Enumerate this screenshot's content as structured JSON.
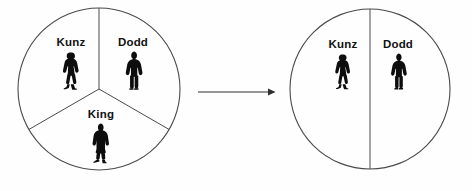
{
  "diagram": {
    "type": "two-state-circle-partition",
    "ink_color": "#4a4a4a",
    "text_color": "#121212",
    "figure_color": "#0d0d0d",
    "background_color": "#ffffff",
    "before": {
      "name": "before-circle",
      "description": "Circle divided into three equal segments",
      "segment_count": 3,
      "center_x": 99,
      "center_y": 89,
      "radius": 81,
      "segments": [
        {
          "id": "kunz",
          "label": "Kunz",
          "label_x": 71,
          "label_y": 46,
          "figure": "woman-walking",
          "figure_x": 72,
          "figure_y": 52,
          "figure_h": 38
        },
        {
          "id": "dodd",
          "label": "Dodd",
          "label_x": 133,
          "label_y": 46,
          "figure": "man-in-suit",
          "figure_x": 134,
          "figure_y": 52,
          "figure_h": 39
        },
        {
          "id": "king",
          "label": "King",
          "label_x": 101,
          "label_y": 118,
          "figure": "person-in-long-coat",
          "figure_x": 101,
          "figure_y": 124,
          "figure_h": 40
        }
      ]
    },
    "after": {
      "name": "after-circle",
      "description": "Circle divided into two equal halves",
      "segment_count": 2,
      "center_x": 370,
      "center_y": 89,
      "radius": 80,
      "segments": [
        {
          "id": "kunz",
          "label": "Kunz",
          "label_x": 343,
          "label_y": 48,
          "figure": "woman-walking",
          "figure_x": 344,
          "figure_y": 54,
          "figure_h": 36
        },
        {
          "id": "dodd",
          "label": "Dodd",
          "label_x": 398,
          "label_y": 48,
          "figure": "man-in-suit",
          "figure_x": 399,
          "figure_y": 54,
          "figure_h": 36
        }
      ]
    },
    "arrow": {
      "name": "transition-arrow",
      "direction": "right",
      "x1": 198,
      "y1": 92,
      "x2": 274,
      "y2": 92
    }
  }
}
